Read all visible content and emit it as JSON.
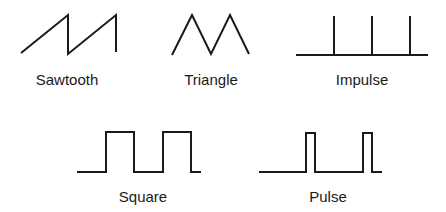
{
  "stroke_color": "#1a1a1a",
  "waveforms": [
    {
      "id": "sawtooth",
      "label": "Sawtooth",
      "points": "21,53 68,15 68,54 116,15 116,52"
    },
    {
      "id": "triangle",
      "label": "Triangle",
      "points": "172,55 192,15 211,54 230,15 249,54"
    },
    {
      "id": "impulse",
      "label": "Impulse",
      "baseline": "296,55 428,55",
      "spikes": [
        334,
        372,
        410
      ]
    },
    {
      "id": "square",
      "label": "Square",
      "points": "77,172 106,172 106,132 134,132 134,172 163,172 163,132 191,132 191,172 201,172"
    },
    {
      "id": "pulse",
      "label": "Pulse",
      "points": "259,172 306,172 306,133 315,133 315,172 363,172 363,133 372,133 372,172 382,172"
    }
  ]
}
